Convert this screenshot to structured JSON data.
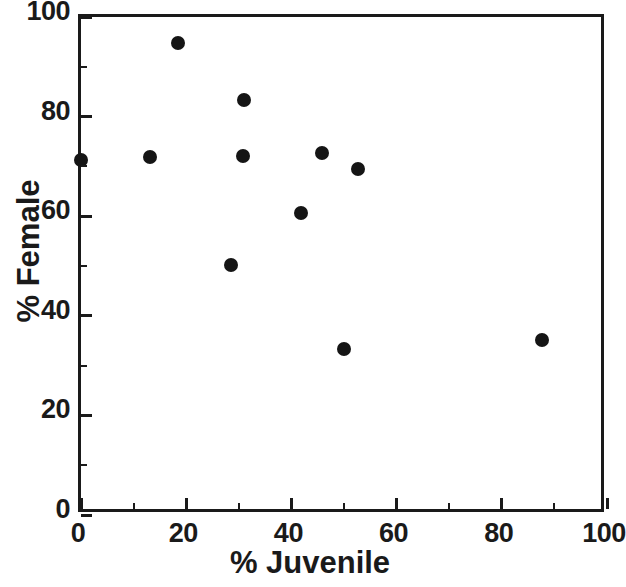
{
  "chart_data": {
    "type": "scatter",
    "title": "",
    "xlabel": "% Juvenile",
    "ylabel": "% Female",
    "xlim": [
      0,
      100
    ],
    "ylim": [
      0,
      100
    ],
    "grid": false,
    "legend": null,
    "x_ticks": [
      0,
      20,
      40,
      60,
      80,
      100
    ],
    "y_ticks": [
      0,
      20,
      40,
      60,
      80,
      100
    ],
    "x_tick_labels": [
      "0",
      "20",
      "40",
      "60",
      "80",
      "100"
    ],
    "y_tick_labels": [
      "0",
      "20",
      "40",
      "60",
      "80",
      "100"
    ],
    "x_minor_step": 10,
    "y_minor_step": 10,
    "marker": "filled-circle",
    "marker_color": "#151515",
    "marker_size_px": 14,
    "axis_color": "#1a1a1a",
    "background_color": "#ffffff",
    "points": [
      {
        "x": 0.0,
        "y": 71.3
      },
      {
        "x": 13.1,
        "y": 71.9
      },
      {
        "x": 18.5,
        "y": 94.8
      },
      {
        "x": 31.0,
        "y": 83.3
      },
      {
        "x": 30.8,
        "y": 72.1
      },
      {
        "x": 28.5,
        "y": 50.2
      },
      {
        "x": 41.8,
        "y": 60.6
      },
      {
        "x": 45.9,
        "y": 72.7
      },
      {
        "x": 52.7,
        "y": 69.4
      },
      {
        "x": 50.0,
        "y": 33.3
      },
      {
        "x": 87.6,
        "y": 35.1
      }
    ]
  }
}
